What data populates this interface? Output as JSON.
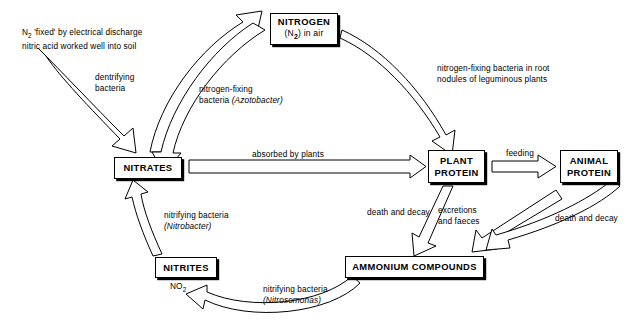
{
  "diagram": {
    "background_color": "#ffffff",
    "line_color": "#000000"
  },
  "nodes": {
    "nitrogen": {
      "label": "NITROGEN",
      "sublabel_pre": "(N",
      "sublabel_sub": "2",
      "sublabel_post": ") in air"
    },
    "nitrates": {
      "label": "NITRATES"
    },
    "plant_protein": {
      "line1": "PLANT",
      "line2": "PROTEIN"
    },
    "animal_protein": {
      "line1": "ANIMAL",
      "line2": "PROTEIN"
    },
    "ammonium": {
      "label": "AMMONIUM COMPOUNDS"
    },
    "nitrites": {
      "label": "NITRITES",
      "formula_pre": "NO",
      "formula_sub": "2"
    }
  },
  "labels": {
    "electrical_discharge": "N₂ 'fixed' by electrical discharge\nnitric acid worked well into soil",
    "electrical_discharge_line1_pre": "N",
    "electrical_discharge_line1_sub": "2",
    "electrical_discharge_line1_post": " 'fixed' by electrical discharge",
    "electrical_discharge_line2": "nitric acid worked well into soil",
    "dentrifying": "dentrifying\nbacteria",
    "azotobacter_line1": "nitrogen-fixing",
    "azotobacter_line2_pre": "bacteria ",
    "azotobacter_line2_italic": "(Azotobacter)",
    "leguminous": "nitrogen-fixing bacteria in root\nnodules of leguminous plants",
    "absorbed_by_plants": "absorbed by plants",
    "feeding": "feeding",
    "death_and_decay_plant": "death and decay",
    "excretions_and_faeces": "excretions\nand faeces",
    "death_and_decay_animal": "death and decay",
    "nitrobacter_line1": "nitrifying bacteria",
    "nitrobacter_line2_italic": "(Nitrobacter)",
    "nitrosomonas_line1": "nitrifying bacteria",
    "nitrosomonas_line2_italic": "(Nitrosomonas)"
  },
  "flows": [
    {
      "id": "discharge-to-nitrates",
      "from": "electrical discharge",
      "to": "nitrates",
      "label": "N2 'fixed' by electrical discharge"
    },
    {
      "id": "nitrates-to-nitrogen",
      "from": "nitrates",
      "to": "nitrogen",
      "label": "dentrifying bacteria"
    },
    {
      "id": "nitrogen-to-nitrates",
      "from": "nitrogen",
      "to": "nitrates",
      "label": "nitrogen-fixing bacteria (Azotobacter)"
    },
    {
      "id": "nitrogen-to-plant",
      "from": "nitrogen",
      "to": "plant_protein",
      "label": "nitrogen-fixing bacteria in root nodules of leguminous plants"
    },
    {
      "id": "nitrates-to-plant",
      "from": "nitrates",
      "to": "plant_protein",
      "label": "absorbed by plants"
    },
    {
      "id": "plant-to-animal",
      "from": "plant_protein",
      "to": "animal_protein",
      "label": "feeding"
    },
    {
      "id": "plant-to-ammonium",
      "from": "plant_protein",
      "to": "ammonium",
      "label": "death and decay"
    },
    {
      "id": "animal-excretions-to-ammonium",
      "from": "animal_protein",
      "to": "ammonium",
      "label": "excretions and faeces"
    },
    {
      "id": "animal-to-ammonium",
      "from": "animal_protein",
      "to": "ammonium",
      "label": "death and decay"
    },
    {
      "id": "ammonium-to-nitrites",
      "from": "ammonium",
      "to": "nitrites",
      "label": "nitrifying bacteria (Nitrosomonas)"
    },
    {
      "id": "nitrites-to-nitrates",
      "from": "nitrites",
      "to": "nitrates",
      "label": "nitrifying bacteria (Nitrobacter)"
    }
  ]
}
